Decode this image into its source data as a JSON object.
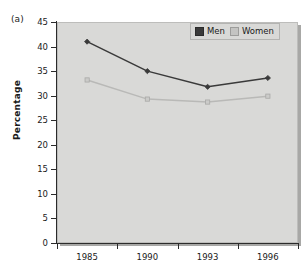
{
  "figure": {
    "panel_label": "(a)",
    "background_color": "#ffffff",
    "plot_background_color": "#d9d9d7"
  },
  "chart_data": {
    "type": "line",
    "title": "",
    "subtitle": "",
    "panel_label": "(a)",
    "xlabel": "",
    "ylabel": "Percentage",
    "categories": [
      "1985",
      "1990",
      "1993",
      "1996"
    ],
    "x": [
      "1985",
      "1990",
      "1993",
      "1996"
    ],
    "series": [
      {
        "name": "Men",
        "color": "#3a3a3a",
        "marker": "diamond",
        "values": [
          41.0,
          35.0,
          31.8,
          33.6
        ]
      },
      {
        "name": "Women",
        "color": "#b9b9b7",
        "marker": "square",
        "values": [
          33.2,
          29.3,
          28.7,
          29.9
        ]
      }
    ],
    "ylim": [
      0,
      45
    ],
    "yticks": [
      0,
      5,
      10,
      15,
      20,
      25,
      30,
      35,
      40,
      45
    ],
    "ytick_labels": [
      "0",
      "5",
      "10",
      "15",
      "20",
      "25",
      "30",
      "35",
      "40",
      "45"
    ],
    "xtick_labels": [
      "1985",
      "1990",
      "1993",
      "1996"
    ],
    "grid": false,
    "legend_position": "top-right",
    "legend_entries": [
      "Men",
      "Women"
    ]
  },
  "legend": {
    "items": [
      {
        "label": "Men",
        "color": "#3a3a3a"
      },
      {
        "label": "Women",
        "color": "#c4c4c2"
      }
    ]
  },
  "axes": {
    "y_title": "Percentage",
    "y_ticks": [
      "45",
      "40",
      "35",
      "30",
      "25",
      "20",
      "15",
      "10",
      "5",
      "0"
    ],
    "x_ticks": [
      "1985",
      "1990",
      "1993",
      "1996"
    ]
  }
}
